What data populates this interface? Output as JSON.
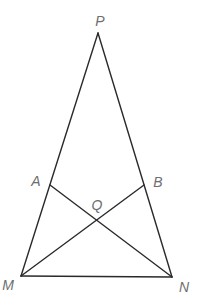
{
  "diagram": {
    "type": "geometry-figure",
    "points": {
      "P": {
        "label": "P",
        "x": 98,
        "y": 33,
        "lx": 100,
        "ly": 26
      },
      "A": {
        "label": "A",
        "x": 50,
        "y": 185,
        "lx": 36,
        "ly": 186
      },
      "B": {
        "label": "B",
        "x": 144,
        "y": 185,
        "lx": 158,
        "ly": 187
      },
      "Q": {
        "label": "Q",
        "x": 97,
        "y": 220,
        "lx": 97,
        "ly": 210
      },
      "M": {
        "label": "M",
        "x": 21,
        "y": 276,
        "lx": 8,
        "ly": 290
      },
      "N": {
        "label": "N",
        "x": 172,
        "y": 277,
        "lx": 184,
        "ly": 292
      }
    },
    "segments": [
      [
        "P",
        "M"
      ],
      [
        "P",
        "N"
      ],
      [
        "M",
        "N"
      ],
      [
        "A",
        "N"
      ],
      [
        "B",
        "M"
      ]
    ],
    "colors": {
      "line": "#2a2a2a",
      "label": "#6e6e6e",
      "background": "#ffffff"
    }
  }
}
